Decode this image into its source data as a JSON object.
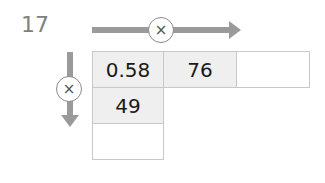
{
  "question": {
    "number": "17"
  },
  "operators": {
    "horizontal": {
      "symbol": "×",
      "icon": "multiply-icon",
      "direction": "right"
    },
    "vertical": {
      "symbol": "×",
      "icon": "multiply-icon",
      "direction": "down"
    }
  },
  "grid": {
    "rows": [
      [
        "0.58",
        "76",
        ""
      ],
      [
        "49",
        null,
        null
      ],
      [
        "",
        null,
        null
      ]
    ]
  },
  "colors": {
    "arrow": "#9a9a9a",
    "cell_shaded": "#efefef",
    "border": "#c8c8c8"
  }
}
